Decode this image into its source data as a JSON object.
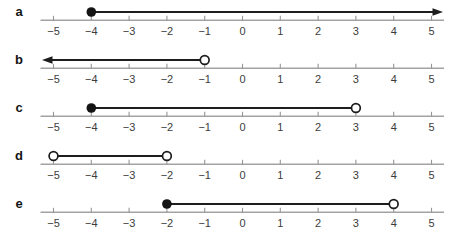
{
  "figure": {
    "rows": [
      {
        "label": "a",
        "interval": {
          "type": "ray",
          "direction": "right",
          "endpoint": {
            "value": -4,
            "closed": true
          }
        }
      },
      {
        "label": "b",
        "interval": {
          "type": "ray",
          "direction": "left",
          "endpoint": {
            "value": -1,
            "closed": false
          }
        }
      },
      {
        "label": "c",
        "interval": {
          "type": "segment",
          "start": {
            "value": -4,
            "closed": true
          },
          "end": {
            "value": 3,
            "closed": false
          }
        }
      },
      {
        "label": "d",
        "interval": {
          "type": "segment",
          "start": {
            "value": -5,
            "closed": false
          },
          "end": {
            "value": -2,
            "closed": false
          }
        }
      },
      {
        "label": "e",
        "interval": {
          "type": "segment",
          "start": {
            "value": -2,
            "closed": true
          },
          "end": {
            "value": 4,
            "closed": false
          }
        }
      }
    ],
    "axis": {
      "min": -5,
      "max": 5,
      "ticks": [
        {
          "value": -5,
          "label": "−5"
        },
        {
          "value": -4,
          "label": "−4"
        },
        {
          "value": -3,
          "label": "−3"
        },
        {
          "value": -2,
          "label": "−2"
        },
        {
          "value": -1,
          "label": "−1"
        },
        {
          "value": 0,
          "label": "0"
        },
        {
          "value": 1,
          "label": "1"
        },
        {
          "value": 2,
          "label": "2"
        },
        {
          "value": 3,
          "label": "3"
        },
        {
          "value": 4,
          "label": "4"
        },
        {
          "value": 5,
          "label": "5"
        }
      ]
    },
    "colors": {
      "background": "#ffffff",
      "axis": "#a3a3a3",
      "tick": "#969696",
      "tick_label": "#3c3c3c",
      "line": "#1d1d1d",
      "dot_fill": "#141414",
      "open_fill": "#ffffff",
      "row_label": "#141414"
    }
  }
}
